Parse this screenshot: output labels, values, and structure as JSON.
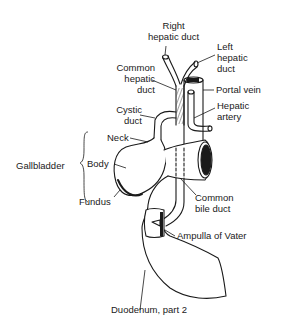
{
  "figure": {
    "labels": {
      "right_hepatic_duct": [
        "Right",
        "hepatic duct"
      ],
      "left_hepatic_duct": [
        "Left",
        "hepatic",
        "duct"
      ],
      "common_hepatic_duct": [
        "Common",
        "hepatic",
        "duct"
      ],
      "portal_vein": "Portal vein",
      "hepatic_artery": [
        "Hepatic",
        "artery"
      ],
      "cystic_duct": [
        "Cystic",
        "duct"
      ],
      "neck": "Neck",
      "gallbladder": "Gallbladder",
      "body": "Body",
      "fundus": "Fundus",
      "common_bile_duct": [
        "Common",
        "bile duct"
      ],
      "ampulla_of_vater": "Ampulla of Vater",
      "duodenum": "Duodenum, part 2"
    },
    "colors": {
      "ink": "#1a1a1a",
      "background": "#ffffff"
    }
  }
}
